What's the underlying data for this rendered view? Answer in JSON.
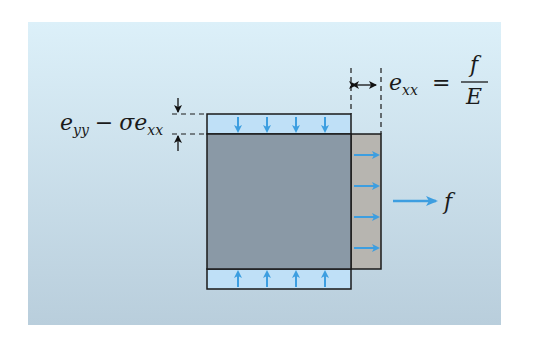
{
  "figure": {
    "labels": {
      "vertical_strain": {
        "e": "e",
        "yy": "yy",
        "minus": "−",
        "sigma": "σ",
        "e2": "e",
        "xx": "xx",
        "full": "e_yy − σ e_xx"
      },
      "horizontal_strain": {
        "e": "e",
        "xx": "xx",
        "equals": "=",
        "numerator": "f",
        "denominator": "E",
        "full": "e_xx = f / E"
      },
      "force": "f"
    },
    "colors": {
      "panel_top": "#dbeff8",
      "panel_bottom": "#b9cfdd",
      "block_fill": "#8a99a6",
      "stretch_fill": "#b7b5b0",
      "plate_fill": "#bfe0f7",
      "arrow_blue": "#3d9ee0",
      "outline": "#1a1a1a"
    },
    "arrows": {
      "top_count": 4,
      "bottom_count": 4,
      "right_count": 4
    }
  }
}
